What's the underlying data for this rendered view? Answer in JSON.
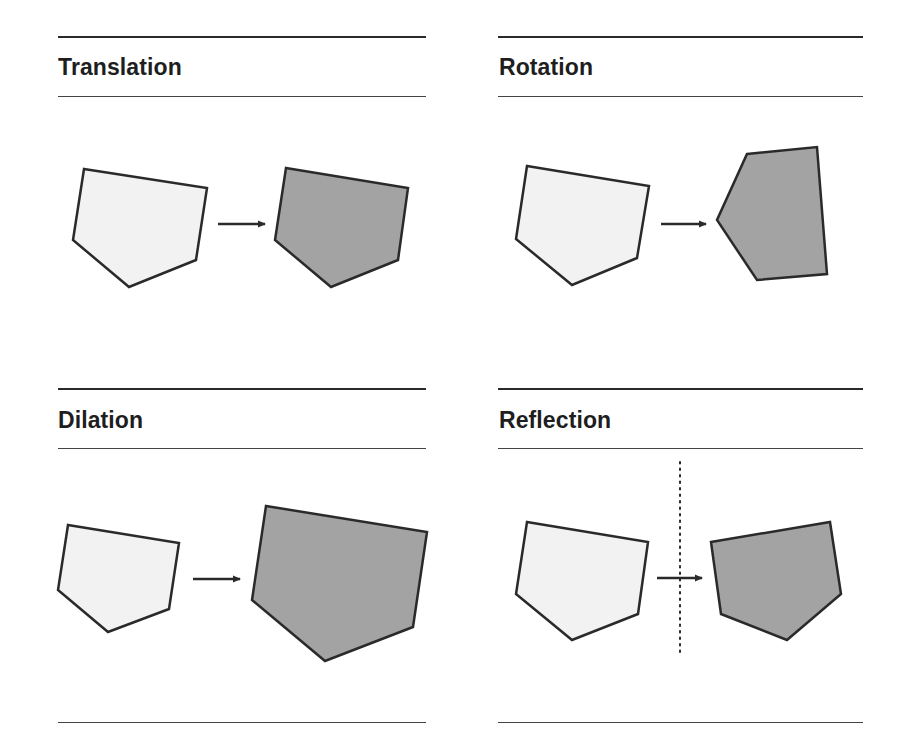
{
  "panels": [
    {
      "title": "Translation"
    },
    {
      "title": "Rotation"
    },
    {
      "title": "Dilation"
    },
    {
      "title": "Reflection"
    }
  ],
  "colors": {
    "original_fill": "#f2f2f2",
    "image_fill": "#a3a3a3",
    "stroke": "#2a2a2a"
  }
}
